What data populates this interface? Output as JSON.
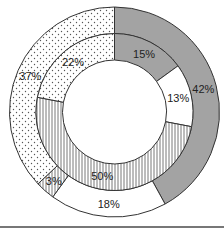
{
  "chart_data": {
    "type": "pie",
    "subtype": "double-donut",
    "title": "",
    "start_angle_deg": 0,
    "direction": "clockwise",
    "rings": [
      {
        "name": "outer",
        "slices": [
          {
            "label": "42%",
            "value": 42,
            "pattern": "gray"
          },
          {
            "label": "18%",
            "value": 18,
            "pattern": "white"
          },
          {
            "label": "3%",
            "value": 3,
            "pattern": "vertical-stripes"
          },
          {
            "label": "37%",
            "value": 37,
            "pattern": "dots"
          }
        ]
      },
      {
        "name": "inner",
        "slices": [
          {
            "label": "15%",
            "value": 15,
            "pattern": "gray"
          },
          {
            "label": "13%",
            "value": 13,
            "pattern": "white"
          },
          {
            "label": "50%",
            "value": 50,
            "pattern": "vertical-stripes"
          },
          {
            "label": "22%",
            "value": 22,
            "pattern": "dots"
          }
        ]
      }
    ],
    "colors": {
      "gray": "#a3a3a3",
      "white": "#ffffff",
      "stroke": "#333333"
    }
  }
}
